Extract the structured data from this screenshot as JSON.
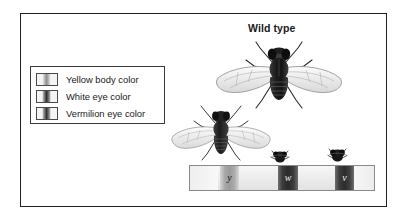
{
  "figure": {
    "title": "Wild type",
    "outer_border_color": "#231f20"
  },
  "legend": {
    "items": [
      {
        "label": "Yellow body color",
        "swatch": "chromosome-band-swatch-yellow",
        "band_style": "band-yellow"
      },
      {
        "label": "White eye color",
        "swatch": "chromosome-band-swatch-white",
        "band_style": "band-white"
      },
      {
        "label": "Vermilion eye color",
        "swatch": "chromosome-band-swatch-vermilion",
        "band_style": "band-vermilion"
      }
    ]
  },
  "flies": [
    {
      "name": "wild-type-fly",
      "role": "Wild type"
    },
    {
      "name": "mutant-fly",
      "role": ""
    },
    {
      "name": "fly-head-white",
      "role": ""
    },
    {
      "name": "fly-head-vermilion",
      "role": ""
    }
  ],
  "chromosome": {
    "name": "X chromosome map",
    "loci": [
      {
        "symbol": "y",
        "gene": "yellow body color"
      },
      {
        "symbol": "w",
        "gene": "white eye color"
      },
      {
        "symbol": "v",
        "gene": "vermilion eye color"
      }
    ]
  }
}
